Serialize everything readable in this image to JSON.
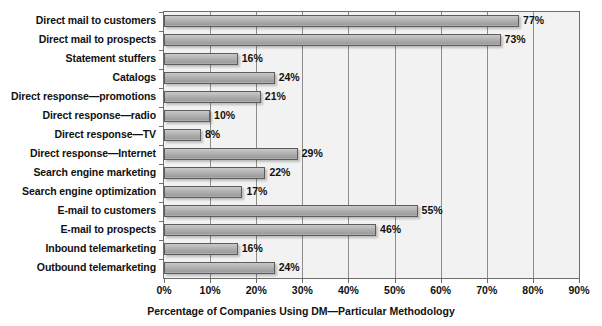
{
  "chart_data": {
    "type": "bar",
    "orientation": "horizontal",
    "title": "",
    "xlabel": "Percentage of Companies Using DM—Particular Methodology",
    "ylabel": "",
    "xlim": [
      0,
      90
    ],
    "xticks": [
      0,
      10,
      20,
      30,
      40,
      50,
      60,
      70,
      80,
      90
    ],
    "xtick_labels": [
      "0%",
      "10%",
      "20%",
      "30%",
      "40%",
      "50%",
      "60%",
      "70%",
      "80%",
      "90%"
    ],
    "grid": true,
    "legend": "none",
    "value_suffix": "%",
    "categories": [
      "Direct mail to customers",
      "Direct mail to prospects",
      "Statement stuffers",
      "Catalogs",
      "Direct response—promotions",
      "Direct response—radio",
      "Direct response—TV",
      "Direct response—Internet",
      "Search engine marketing",
      "Search engine optimization",
      "E-mail to customers",
      "E-mail to prospects",
      "Inbound telemarketing",
      "Outbound telemarketing"
    ],
    "values": [
      77,
      73,
      16,
      24,
      21,
      10,
      8,
      29,
      22,
      17,
      55,
      46,
      16,
      24
    ],
    "value_labels": [
      "77%",
      "73%",
      "16%",
      "24%",
      "21%",
      "10%",
      "8%",
      "29%",
      "22%",
      "17%",
      "55%",
      "46%",
      "16%",
      "24%"
    ]
  },
  "colors": {
    "bar_fill": "#ababab",
    "bar_border": "#5c5c5c",
    "plot_background": "#f2f2f2",
    "gridline": "#8d8d8d",
    "axis": "#6d6d6d",
    "text": "#111111",
    "page_background": "#ffffff"
  }
}
